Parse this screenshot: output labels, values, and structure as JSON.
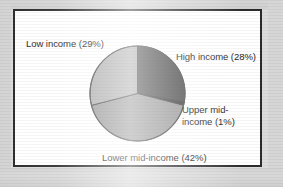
{
  "figure": {
    "frame_color": "#2b2b2b",
    "background_color": "#ffffff",
    "scan_background_color": "#dcdcdc"
  },
  "labels": {
    "low_income": "Low income (29%)",
    "high_income": "High income (28%)",
    "upper_mid_income_line1": "Upper mid-",
    "upper_mid_income_line2": "income (1%)",
    "lower_mid_income": "Lower mid-income (42%)"
  },
  "chart_data": {
    "type": "pie",
    "title": "",
    "subtitle": "",
    "xlabel": "",
    "ylabel": "",
    "legend_position": "none",
    "grid": false,
    "start_angle_deg": 0,
    "direction": "clockwise",
    "center": {
      "x": 139,
      "y": 94
    },
    "radius": 48,
    "labels": [
      "High income (28%)",
      "Upper mid-income (1%)",
      "Lower mid-income (42%)",
      "Low income (29%)"
    ],
    "categories": [
      "High income",
      "Upper mid-income",
      "Lower mid-income",
      "Low income"
    ],
    "values": [
      28,
      1,
      42,
      29
    ],
    "units": "percent",
    "total": 100,
    "colors": [
      "#4a4a4a",
      "#3a3a3a",
      "#999999",
      "#aeaeae"
    ],
    "slices": [
      {
        "name": "High income",
        "value": 28,
        "label": "High income (28%)",
        "color": "#4a4a4a",
        "start_deg": 0,
        "end_deg": 100.8
      },
      {
        "name": "Upper mid-income",
        "value": 1,
        "label": "Upper mid-income (1%)",
        "color": "#3a3a3a",
        "start_deg": 100.8,
        "end_deg": 104.4
      },
      {
        "name": "Lower mid-income",
        "value": 42,
        "label": "Lower mid-income (42%)",
        "color": "#999999",
        "start_deg": 104.4,
        "end_deg": 255.6
      },
      {
        "name": "Low income",
        "value": 29,
        "label": "Low income (29%)",
        "color": "#aeaeae",
        "start_deg": 255.6,
        "end_deg": 360
      }
    ]
  }
}
